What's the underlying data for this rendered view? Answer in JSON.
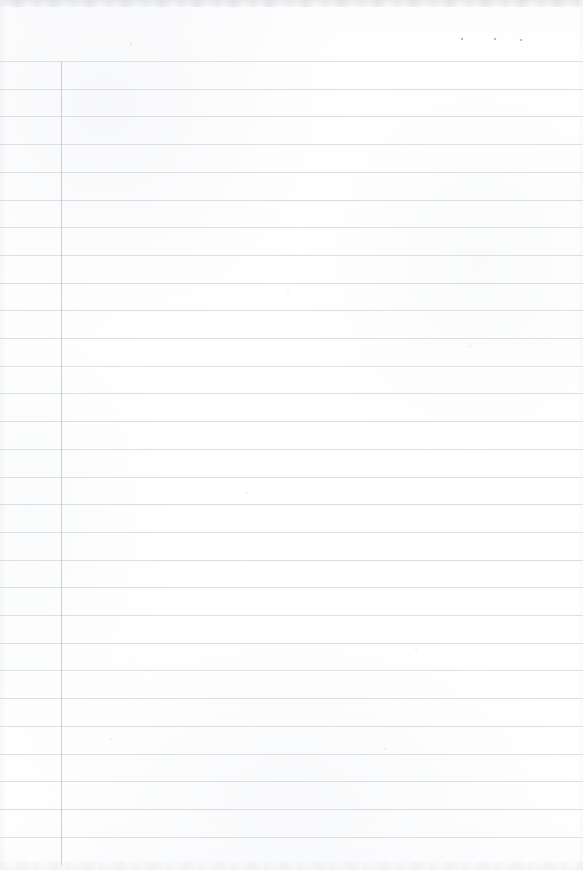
{
  "document": {
    "type": "scanned-blank-ruled-page",
    "title": "Blank ruled notebook page",
    "content_text": "",
    "width": 583,
    "height": 870,
    "paper_color": "#ffffff",
    "rule_color": "#d7d9dd",
    "margin_rule_color": "#c9ccd1",
    "edge_shadow_color": "#e2e4e7"
  },
  "ruling": {
    "horizontal_line_count": 29,
    "first_line_y": 61,
    "line_spacing": 27.7,
    "line_thickness": 1,
    "line_left_x": 0,
    "line_right_x": 583,
    "horizontal_line_ys": [
      61,
      88.7,
      116.4,
      144.1,
      171.8,
      199.5,
      227.2,
      254.9,
      282.6,
      310.3,
      338,
      365.7,
      393.4,
      421.1,
      448.8,
      476.5,
      504.2,
      531.9,
      559.6,
      587.3,
      615,
      642.7,
      670.4,
      698.1,
      725.8,
      753.5,
      781.2,
      808.9,
      836.6
    ],
    "vertical_rule": {
      "x": 61,
      "y_start": 61,
      "y_end": 865,
      "thickness": 1,
      "label": "left margin rule"
    }
  },
  "marks": {
    "top_dots": [
      {
        "x": 461,
        "y": 38,
        "size": 2.2,
        "color": "#8d9094"
      },
      {
        "x": 494,
        "y": 38,
        "size": 2.0,
        "color": "#93969a"
      },
      {
        "x": 520,
        "y": 39,
        "size": 2.0,
        "color": "#9a9da1"
      }
    ],
    "specks": [
      {
        "x": 130,
        "y": 43,
        "size": 1.6,
        "opacity": 0.16
      },
      {
        "x": 287,
        "y": 290,
        "size": 1.5,
        "opacity": 0.14
      },
      {
        "x": 469,
        "y": 345,
        "size": 1.5,
        "opacity": 0.13
      },
      {
        "x": 520,
        "y": 256,
        "size": 1.4,
        "opacity": 0.12
      },
      {
        "x": 246,
        "y": 492,
        "size": 1.5,
        "opacity": 0.13
      },
      {
        "x": 246,
        "y": 566,
        "size": 1.4,
        "opacity": 0.12
      },
      {
        "x": 415,
        "y": 648,
        "size": 1.8,
        "opacity": 0.15
      },
      {
        "x": 135,
        "y": 659,
        "size": 1.4,
        "opacity": 0.12
      },
      {
        "x": 110,
        "y": 738,
        "size": 1.5,
        "opacity": 0.13
      },
      {
        "x": 384,
        "y": 748,
        "size": 1.5,
        "opacity": 0.13
      },
      {
        "x": 196,
        "y": 812,
        "size": 1.4,
        "opacity": 0.12
      },
      {
        "x": 72,
        "y": 516,
        "size": 1.3,
        "opacity": 0.11
      },
      {
        "x": 355,
        "y": 680,
        "size": 1.3,
        "opacity": 0.11
      },
      {
        "x": 540,
        "y": 760,
        "size": 1.3,
        "opacity": 0.11
      }
    ]
  }
}
